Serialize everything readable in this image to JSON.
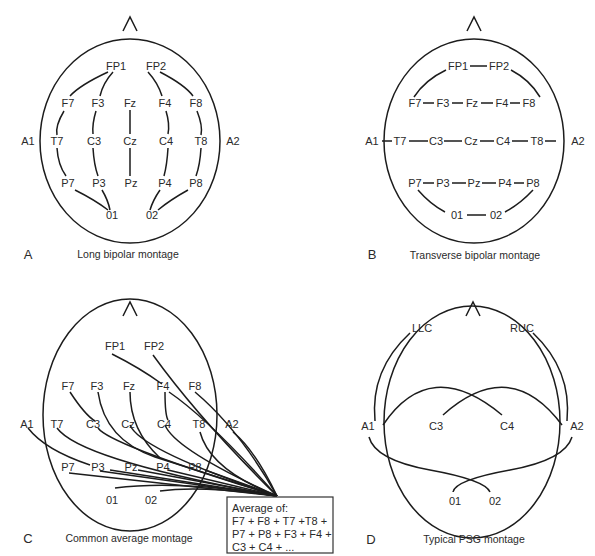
{
  "figure": {
    "panels": [
      {
        "letter": "A",
        "caption": "Long bipolar montage",
        "electrodes": {
          "FP1": "FP1",
          "FP2": "FP2",
          "F7": "F7",
          "F3": "F3",
          "Fz": "Fz",
          "F4": "F4",
          "F8": "F8",
          "A1": "A1",
          "T7": "T7",
          "C3": "C3",
          "Cz": "Cz",
          "C4": "C4",
          "T8": "T8",
          "A2": "A2",
          "P7": "P7",
          "P3": "P3",
          "Pz": "Pz",
          "P4": "P4",
          "P8": "P8",
          "O1": "01",
          "O2": "02"
        },
        "chains": [
          [
            "FP1",
            "F7",
            "T7",
            "P7",
            "01"
          ],
          [
            "FP1",
            "F3",
            "C3",
            "P3",
            "01"
          ],
          [
            "Fz",
            "Cz",
            "Pz"
          ],
          [
            "FP2",
            "F4",
            "C4",
            "P4",
            "02"
          ],
          [
            "FP2",
            "F8",
            "T8",
            "P8",
            "02"
          ]
        ]
      },
      {
        "letter": "B",
        "caption": "Transverse bipolar montage",
        "electrodes": {
          "FP1": "FP1",
          "FP2": "FP2",
          "F7": "F7",
          "F3": "F3",
          "Fz": "Fz",
          "F4": "F4",
          "F8": "F8",
          "A1": "A1",
          "T7": "T7",
          "C3": "C3",
          "Cz": "Cz",
          "C4": "C4",
          "T8": "T8",
          "A2": "A2",
          "P7": "P7",
          "P3": "P3",
          "Pz": "Pz",
          "P4": "P4",
          "P8": "P8",
          "O1": "01",
          "O2": "02"
        },
        "chains": [
          [
            "F7",
            "FP1",
            "FP2",
            "F8"
          ],
          [
            "F7",
            "F3",
            "Fz",
            "F4",
            "F8"
          ],
          [
            "A1",
            "T7",
            "C3",
            "Cz",
            "C4",
            "T8",
            "A2"
          ],
          [
            "P7",
            "P3",
            "Pz",
            "P4",
            "P8"
          ],
          [
            "P7",
            "01",
            "02",
            "P8"
          ]
        ]
      },
      {
        "letter": "C",
        "caption": "Common average montage",
        "electrodes": {
          "FP1": "FP1",
          "FP2": "FP2",
          "F7": "F7",
          "F3": "F3",
          "Fz": "Fz",
          "F4": "F4",
          "F8": "F8",
          "A1": "A1",
          "T7": "T7",
          "C3": "C3",
          "Cz": "Cz",
          "C4": "C4",
          "T8": "T8",
          "A2": "A2",
          "P7": "P7",
          "P3": "P3",
          "Pz": "Pz",
          "P4": "P4",
          "P8": "P8",
          "O1": "01",
          "O2": "02"
        },
        "reference_box": {
          "line1": "Average of:",
          "line2": "F7 + F8 + T7 +T8 +",
          "line3": "P7 + P8 + F3 + F4 +",
          "line4": "C3 + C4 + ..."
        }
      },
      {
        "letter": "D",
        "caption": "Typical PSG montage",
        "electrodes": {
          "LLC": "LLC",
          "RUC": "RUC",
          "A1": "A1",
          "C3": "C3",
          "C4": "C4",
          "A2": "A2",
          "O1": "01",
          "O2": "02"
        },
        "derivations": [
          [
            "LLC",
            "A2"
          ],
          [
            "RUC",
            "A1"
          ],
          [
            "C3",
            "A2"
          ],
          [
            "C4",
            "A1"
          ],
          [
            "01",
            "A2"
          ],
          [
            "02",
            "A1"
          ]
        ]
      }
    ],
    "nose_marker": "^"
  }
}
